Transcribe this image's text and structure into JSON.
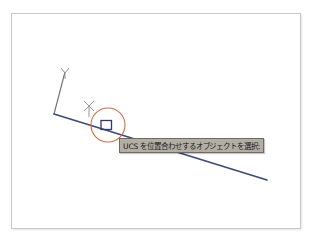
{
  "window": {
    "app_name": "AutoCAD",
    "background_color": "#ffffff",
    "frame_border_color": "#c8c8c8"
  },
  "canvas": {
    "name": "drawing-area",
    "background_color": "#ffffff",
    "width": 290,
    "height": 216
  },
  "ucs_icon": {
    "name": "ucs-icon",
    "y_axis_label": "Y",
    "x_axis_label": "X",
    "color": "#6d6d74",
    "origin": {
      "x": 42,
      "y": 100
    },
    "y_axis_tip": {
      "x": 53,
      "y": 54
    }
  },
  "geometry": {
    "line": {
      "name": "drawing-line",
      "color": "#3c4a78",
      "stroke_width": 1.6,
      "start": {
        "x": 42,
        "y": 100
      },
      "end": {
        "x": 255,
        "y": 166
      }
    }
  },
  "cursor": {
    "pickbox": {
      "name": "pickbox-cursor",
      "color": "#2f3b66",
      "x": 89,
      "y": 106,
      "width": 10,
      "height": 9
    },
    "aperture_circle": {
      "name": "aperture-circle",
      "color": "#cf6d49",
      "center": {
        "x": 96,
        "y": 111
      },
      "radius": 17
    },
    "crosshair": {
      "name": "crosshair-marker",
      "color": "#8d8d95",
      "center": {
        "x": 77,
        "y": 92
      },
      "size": 11
    }
  },
  "prompt": {
    "name": "command-prompt-tooltip",
    "text": "UCS を位置合わせするオブジェクトを選択:",
    "background_color": "#b3aea4",
    "border_color": "#6f6a62",
    "text_color": "#17171c"
  }
}
